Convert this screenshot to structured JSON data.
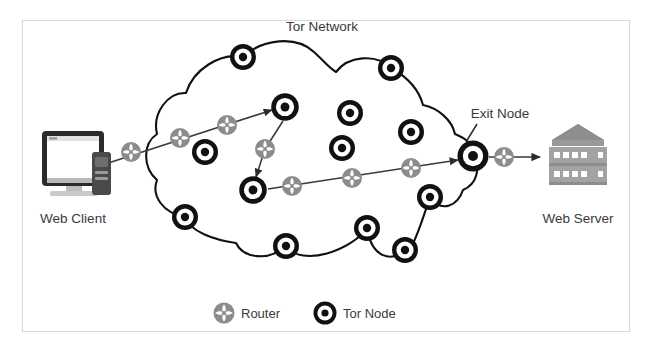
{
  "figure": {
    "title_label": "Tor Network",
    "border_color": "#d9d9d9",
    "background": "#ffffff"
  },
  "labels": {
    "tor_network": "Tor Network",
    "exit_node": "Exit Node",
    "web_client": "Web Client",
    "web_server": "Web Server"
  },
  "legend": {
    "items": [
      {
        "icon": "router-icon",
        "label": "Router",
        "color": "#8c8c8c"
      },
      {
        "icon": "tor-node-icon",
        "label": "Tor Node",
        "color": "#111111"
      }
    ]
  },
  "icons": {
    "router": "router-icon",
    "tor_node": "tor-node-icon",
    "web_client": "desktop-computer-icon",
    "web_server": "server-rack-icon",
    "arrow": "arrow-right-icon"
  },
  "colors": {
    "router_fill": "#8c8c8c",
    "router_blade": "#ffffff",
    "node_ring": "#111111",
    "node_inner": "#ffffff",
    "node_center": "#111111",
    "cloud_stroke": "#111111",
    "path_stroke": "#3a3a3a",
    "server_body": "#9e9e9e",
    "server_top": "#8a8a8a",
    "monitor_bezel": "#2b2b2b",
    "monitor_screen": "#ffffff",
    "tower_body": "#4a4a4a",
    "text": "#3a3a3a"
  },
  "diagram_data": {
    "type": "network-diagram",
    "description": "Tor anonymity network routing diagram: a web client connects through routers into a cloud of Tor nodes, traverses a multi-hop circuit, exits at the Exit Node and reaches the web server.",
    "endpoints": [
      {
        "name": "web-client",
        "label": "Web Client",
        "x": 78,
        "y": 160
      },
      {
        "name": "web-server",
        "label": "Web Server",
        "x": 578,
        "y": 160
      }
    ],
    "tor_nodes": [
      {
        "id": "n1",
        "x": 243,
        "y": 57,
        "r": 13
      },
      {
        "id": "n2",
        "x": 391,
        "y": 68,
        "r": 13
      },
      {
        "id": "n3",
        "x": 350,
        "y": 113,
        "r": 13
      },
      {
        "id": "n4",
        "x": 285,
        "y": 107,
        "r": 14
      },
      {
        "id": "n5",
        "x": 205,
        "y": 152,
        "r": 13
      },
      {
        "id": "n6",
        "x": 342,
        "y": 148,
        "r": 13
      },
      {
        "id": "n7",
        "x": 411,
        "y": 132,
        "r": 13
      },
      {
        "id": "n8",
        "x": 253,
        "y": 190,
        "r": 14
      },
      {
        "id": "n9",
        "x": 185,
        "y": 217,
        "r": 13
      },
      {
        "id": "n10",
        "x": 430,
        "y": 197,
        "r": 13
      },
      {
        "id": "n11",
        "x": 286,
        "y": 246,
        "r": 13
      },
      {
        "id": "n12",
        "x": 367,
        "y": 228,
        "r": 13
      },
      {
        "id": "n13",
        "x": 405,
        "y": 250,
        "r": 13
      },
      {
        "id": "exit",
        "x": 473,
        "y": 156,
        "r": 15,
        "label": "Exit Node"
      }
    ],
    "routers": [
      {
        "id": "r1",
        "x": 131,
        "y": 152,
        "r": 10
      },
      {
        "id": "r2",
        "x": 180,
        "y": 138,
        "r": 10
      },
      {
        "id": "r3",
        "x": 227,
        "y": 125,
        "r": 10
      },
      {
        "id": "r4",
        "x": 265,
        "y": 149,
        "r": 10
      },
      {
        "id": "r5",
        "x": 292,
        "y": 186,
        "r": 10
      },
      {
        "id": "r6",
        "x": 352,
        "y": 178,
        "r": 10
      },
      {
        "id": "r7",
        "x": 411,
        "y": 168,
        "r": 10
      },
      {
        "id": "r8",
        "x": 504,
        "y": 157,
        "r": 10
      }
    ],
    "circuit_path": [
      "web-client -> r1 -> r2 -> r3 -> n4",
      "n4 -> r4 -> n8",
      "n8 -> r5 -> r6 -> r7 -> exit",
      "exit -> r8 -> web-server"
    ]
  }
}
